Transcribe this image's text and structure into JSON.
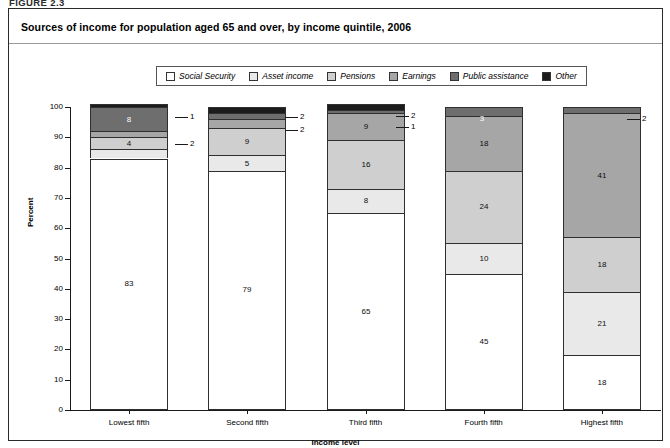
{
  "figure_number": "FIGURE 2.3",
  "panel": {
    "title": "Sources of income for population aged 65 and over, by income quintile, 2006"
  },
  "legend": {
    "items": [
      {
        "label": "Social Security",
        "color": "#ffffff"
      },
      {
        "label": "Asset income",
        "color": "#e9e9e9"
      },
      {
        "label": "Pensions",
        "color": "#cfcfcf"
      },
      {
        "label": "Earnings",
        "color": "#a6a6a6"
      },
      {
        "label": "Public assistance",
        "color": "#6e6e6e"
      },
      {
        "label": "Other",
        "color": "#1c1c1c"
      }
    ]
  },
  "chart_data": {
    "type": "bar",
    "stacked": true,
    "title": "Sources of income for population aged 65 and over, by income quintile, 2006",
    "xlabel": "Income level",
    "ylabel": "Percent",
    "ylim": [
      0,
      100
    ],
    "yticks": [
      0,
      10,
      20,
      30,
      40,
      50,
      60,
      70,
      80,
      90,
      100
    ],
    "grid": false,
    "legend_position": "top-center",
    "categories": [
      "Lowest fifth",
      "Second fifth",
      "Third fifth",
      "Fourth fifth",
      "Highest fifth"
    ],
    "series": [
      {
        "name": "Social Security",
        "color": "#ffffff",
        "values": [
          83,
          79,
          65,
          45,
          18
        ]
      },
      {
        "name": "Asset income",
        "color": "#e9e9e9",
        "values": [
          3,
          5,
          8,
          10,
          21
        ]
      },
      {
        "name": "Pensions",
        "color": "#cfcfcf",
        "values": [
          4,
          9,
          16,
          24,
          18
        ]
      },
      {
        "name": "Earnings",
        "color": "#a6a6a6",
        "values": [
          2,
          3,
          9,
          18,
          41
        ]
      },
      {
        "name": "Public assistance",
        "color": "#6e6e6e",
        "values": [
          8,
          2,
          1,
          3,
          2
        ]
      },
      {
        "name": "Other",
        "color": "#1c1c1c",
        "values": [
          1,
          2,
          2,
          0,
          0
        ]
      }
    ],
    "callouts": [
      {
        "category": "Lowest fifth",
        "series": "Other",
        "value": "1"
      },
      {
        "category": "Lowest fifth",
        "series": "Earnings",
        "value": "2"
      },
      {
        "category": "Second fifth",
        "series": "Other",
        "value": "2"
      },
      {
        "category": "Second fifth",
        "series": "Public assistance",
        "value": "2"
      },
      {
        "category": "Third fifth",
        "series": "Other",
        "value": "2"
      },
      {
        "category": "Third fifth",
        "series": "Public assistance",
        "value": "1"
      },
      {
        "category": "Fourth fifth",
        "series": "Public assistance",
        "value": "3"
      },
      {
        "category": "Highest fifth",
        "series": "Earnings-top",
        "value": "2"
      }
    ]
  }
}
